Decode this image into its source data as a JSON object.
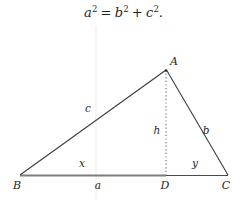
{
  "formula": {
    "base_a": "a",
    "exp_a": "2",
    "equals": "=",
    "base_b": "b",
    "exp_b": "2",
    "plus": "+",
    "base_c": "c",
    "exp_c": "2",
    "period": "."
  },
  "diagram": {
    "type": "triangle-with-altitude",
    "vertices": [
      {
        "name": "A",
        "label": "A",
        "x": 166,
        "y": 70,
        "label_x": 174,
        "label_y": 65
      },
      {
        "name": "B",
        "label": "B",
        "x": 20,
        "y": 175,
        "label_x": 17,
        "label_y": 189
      },
      {
        "name": "C",
        "label": "C",
        "x": 228,
        "y": 175,
        "label_x": 225,
        "label_y": 189
      },
      {
        "name": "D",
        "label": "D",
        "x": 166,
        "y": 175,
        "label_x": 163,
        "label_y": 189
      }
    ],
    "side_labels": [
      {
        "name": "side-c",
        "label": "c",
        "x": 88,
        "y": 112
      },
      {
        "name": "side-b",
        "label": "b",
        "x": 205,
        "y": 134
      },
      {
        "name": "altitude-h",
        "label": "h",
        "x": 155,
        "y": 134
      },
      {
        "name": "segment-x",
        "label": "x",
        "x": 80,
        "y": 167
      },
      {
        "name": "segment-y",
        "label": "y",
        "x": 193,
        "y": 167
      },
      {
        "name": "base-a",
        "label": "a",
        "x": 96,
        "y": 189
      }
    ],
    "colors": {
      "stroke": "#3d3d3d",
      "base_highlight": "#7a7a7a",
      "altitude_dotted": "#9a9a9a",
      "guide_line": "#e8e8f2",
      "text": "#1f1f1f"
    }
  }
}
